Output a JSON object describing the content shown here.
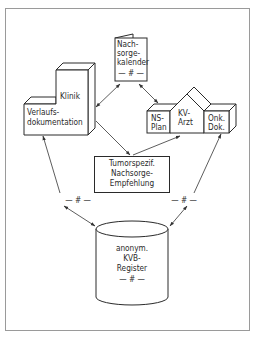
{
  "diagram": {
    "nodes": {
      "klinik": {
        "title": "Klinik",
        "line1": "Verlaufs-",
        "line2": "dokumentation"
      },
      "kalender": {
        "line1": "Nach-",
        "line2": "sorge-",
        "line3": "kalender",
        "mark": "— # —"
      },
      "ns_plan": {
        "line1": "NS-",
        "line2": "Plan"
      },
      "kv_arzt": {
        "line1": "KV-",
        "line2": "Arzt"
      },
      "onk_dok": {
        "line1": "Onk.",
        "line2": "Dok."
      },
      "tumor": {
        "line1": "Tumorspezif.",
        "line2": "Nachsorge-",
        "line3": "Empfehlung"
      },
      "register": {
        "line1": "anonym.",
        "line2": "KVB-",
        "line3": "Register",
        "mark": "— # —"
      }
    },
    "edge_marks": {
      "left": "— # —",
      "right": "— # —"
    },
    "edges": [
      {
        "from": "klinik",
        "to": "kalender",
        "type": "bidirectional"
      },
      {
        "from": "kalender",
        "to": "ns_plan",
        "type": "bidirectional"
      },
      {
        "from": "klinik",
        "to": "tumor",
        "type": "directed"
      },
      {
        "from": "tumor",
        "to": "kv_arzt",
        "type": "directed"
      },
      {
        "from": "klinik",
        "to": "register",
        "type": "bidirectional",
        "mark": "#"
      },
      {
        "from": "onk_dok",
        "to": "register",
        "type": "bidirectional",
        "mark": "#"
      }
    ]
  }
}
